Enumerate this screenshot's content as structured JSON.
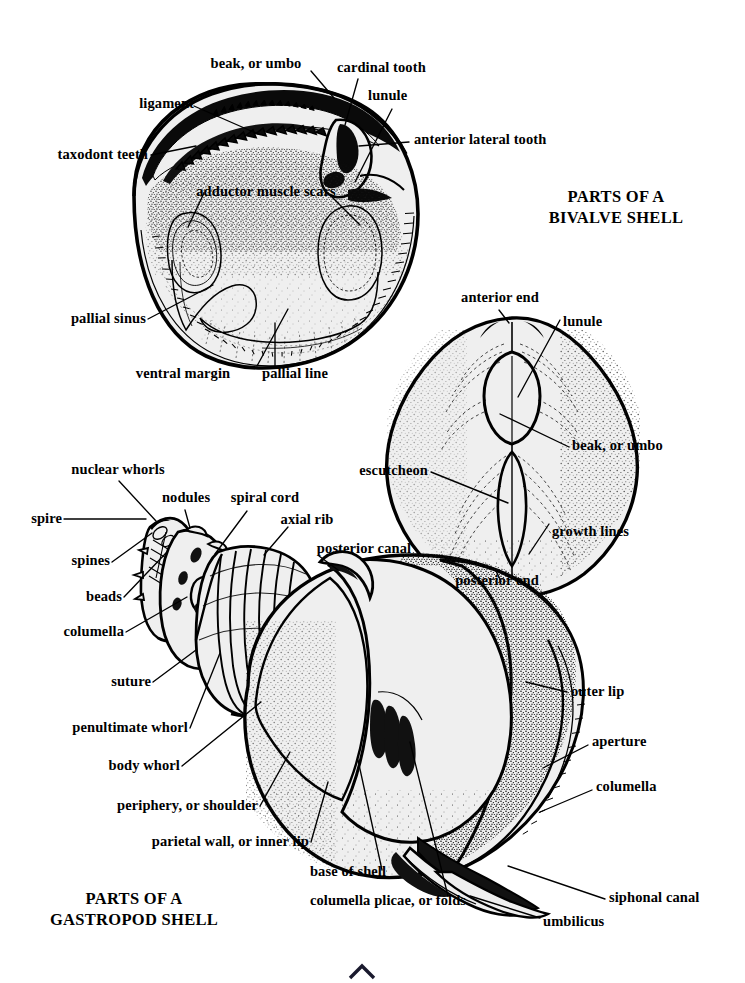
{
  "document": {
    "kind": "anatomical-diagram",
    "background_color": "#ffffff",
    "ink_color": "#000000",
    "shell_fill_color": "#efefef"
  },
  "titles": {
    "bivalve": {
      "line1": "PARTS OF A",
      "line2": "BIVALVE SHELL"
    },
    "gastropod": {
      "line1": "PARTS OF A",
      "line2": "GASTROPOD SHELL"
    }
  },
  "figures": [
    {
      "id": "bivalve-interior",
      "name": "Bivalve shell, interior view",
      "labels": [
        "beak, or umbo",
        "cardinal tooth",
        "ligament",
        "lunule",
        "taxodont teeth",
        "anterior lateral tooth",
        "adductor muscle scars",
        "pallial sinus",
        "ventral margin",
        "pallial line"
      ]
    },
    {
      "id": "bivalve-exterior",
      "name": "Bivalve shell, dorsal/exterior view",
      "labels": [
        "anterior end",
        "lunule",
        "beak, or umbo",
        "escutcheon",
        "growth lines",
        "posterior end"
      ]
    },
    {
      "id": "gastropod",
      "name": "Gastropod shell",
      "labels": [
        "nuclear whorls",
        "nodules",
        "spiral cord",
        "spire",
        "axial rib",
        "spines",
        "posterior canal",
        "beads",
        "columella",
        "suture",
        "penultimate whorl",
        "body whorl",
        "periphery, or shoulder",
        "parietal wall, or inner lip",
        "base of shell",
        "columella plicae, or folds",
        "outer lip",
        "aperture",
        "columella",
        "siphonal canal",
        "umbilicus"
      ]
    }
  ],
  "bivalve_interior_labels": {
    "beak_umbo": "beak, or umbo",
    "cardinal_tooth": "cardinal tooth",
    "ligament": "ligament",
    "lunule": "lunule",
    "taxodont_teeth": "taxodont teeth",
    "anterior_lateral_tooth": "anterior lateral tooth",
    "adductor_muscle_scars": "adductor muscle scars",
    "pallial_sinus": "pallial sinus",
    "ventral_margin": "ventral margin",
    "pallial_line": "pallial line"
  },
  "bivalve_exterior_labels": {
    "anterior_end": "anterior end",
    "lunule": "lunule",
    "beak_umbo": "beak, or umbo",
    "escutcheon": "escutcheon",
    "growth_lines": "growth lines",
    "posterior_end": "posterior end"
  },
  "gastropod_labels": {
    "nuclear_whorls": "nuclear whorls",
    "nodules": "nodules",
    "spiral_cord": "spiral cord",
    "spire": "spire",
    "axial_rib": "axial rib",
    "spines": "spines",
    "posterior_canal": "posterior canal",
    "beads": "beads",
    "columella_left": "columella",
    "suture": "suture",
    "penultimate_whorl": "penultimate whorl",
    "body_whorl": "body whorl",
    "periphery_shoulder": "periphery, or shoulder",
    "parietal_wall_inner_lip": "parietal wall, or inner lip",
    "base_of_shell": "base of shell",
    "columella_plicae_folds": "columella plicae, or folds",
    "outer_lip": "outer lip",
    "aperture": "aperture",
    "columella_right": "columella",
    "siphonal_canal": "siphonal canal",
    "umbilicus": "umbilicus"
  }
}
